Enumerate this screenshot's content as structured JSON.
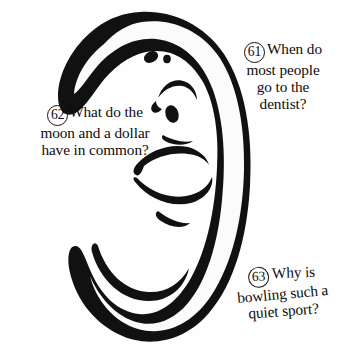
{
  "page": {
    "background_color": "#fefefe",
    "ink_color": "#0d0d0d",
    "illustration_name": "crescent-moon-smiling-face"
  },
  "illustration": {
    "subject": "crescent moon with smiling face",
    "outline_color": "#111111",
    "fill_color": "#ffffff",
    "features": [
      "eye-blob",
      "eye-dot",
      "eyebrow-arc",
      "lower-eye",
      "nose",
      "smiling-mouth"
    ]
  },
  "riddles": [
    {
      "number": "61",
      "lines": [
        "When do",
        "most people",
        "go to the",
        "dentist?"
      ],
      "full_text": "When do most people go to the dentist?"
    },
    {
      "number": "62",
      "lines": [
        "What do the",
        "moon and a dollar",
        "have in common?"
      ],
      "full_text": "What do the moon and a dollar have in common?"
    },
    {
      "number": "63",
      "lines": [
        "Why is",
        "bowling such a",
        "quiet sport?"
      ],
      "full_text": "Why is bowling such a quiet sport?"
    }
  ]
}
